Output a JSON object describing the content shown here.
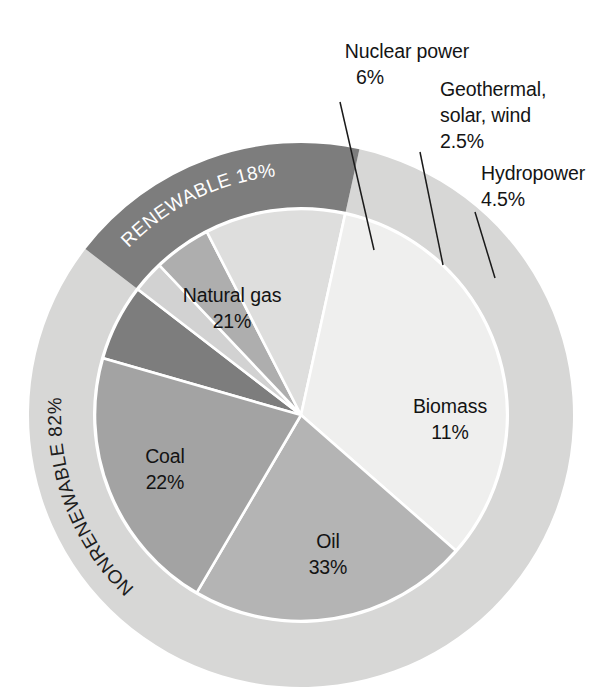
{
  "chart_data": {
    "type": "pie",
    "title": "",
    "subtitle": "",
    "xlabel": "",
    "ylabel": "",
    "legend_position": "none",
    "grid": false,
    "units": "percent",
    "categories": [
      "Nuclear power",
      "Geothermal, solar, wind",
      "Hydropower",
      "Biomass",
      "Oil",
      "Coal",
      "Natural gas"
    ],
    "values": [
      6,
      2.5,
      4.5,
      11,
      33,
      22,
      21
    ],
    "slices": [
      {
        "id": "nuclear",
        "label": "Nuclear power",
        "value": 6,
        "value_text": "6%",
        "color": "#7d7d7d",
        "label_kind": "callout"
      },
      {
        "id": "geothermal",
        "label": "Geothermal,\nsolar, wind",
        "value": 2.5,
        "value_text": "2.5%",
        "color": "#d2d2d2",
        "label_kind": "callout"
      },
      {
        "id": "hydropower",
        "label": "Hydropower",
        "value": 4.5,
        "value_text": "4.5%",
        "color": "#aeaeae",
        "label_kind": "callout"
      },
      {
        "id": "biomass",
        "label": "Biomass",
        "value": 11,
        "value_text": "11%",
        "color": "#dededd",
        "label_kind": "inside"
      },
      {
        "id": "oil",
        "label": "Oil",
        "value": 33,
        "value_text": "33%",
        "color": "#efefee",
        "label_kind": "inside"
      },
      {
        "id": "coal",
        "label": "Coal",
        "value": 22,
        "value_text": "22%",
        "color": "#b4b4b4",
        "label_kind": "inside"
      },
      {
        "id": "natural_gas",
        "label": "Natural gas",
        "value": 21,
        "value_text": "21%",
        "color": "#a3a3a3",
        "label_kind": "inside"
      }
    ],
    "outer_ring": [
      {
        "id": "renewable",
        "label": "RENEWABLE",
        "value": 18,
        "value_text": "RENEWABLE 18%",
        "color": "#7d7d7d",
        "text_color": "#ffffff"
      },
      {
        "id": "nonrenewable",
        "label": "NONRENEWABLE",
        "value": 82,
        "value_text": "NONRENEWABLE 82%",
        "color": "#d7d7d6",
        "text_color": "#1d1d1d"
      }
    ]
  },
  "callouts": {
    "nuclear": {
      "line1": "Nuclear power",
      "line2": "6%"
    },
    "geothermal": {
      "line1": "Geothermal,",
      "line2": "solar, wind",
      "line3": "2.5%"
    },
    "hydropower": {
      "line1": "Hydropower",
      "line2": "4.5%"
    }
  },
  "inside_labels": {
    "natural_gas": {
      "line1": "Natural gas",
      "line2": "21%"
    },
    "coal": {
      "line1": "Coal",
      "line2": "22%"
    },
    "oil": {
      "line1": "Oil",
      "line2": "33%"
    },
    "biomass": {
      "line1": "Biomass",
      "line2": "11%"
    }
  },
  "ring_labels": {
    "renewable": "RENEWABLE 18%",
    "nonrenewable": "NONRENEWABLE 82%"
  },
  "geometry": {
    "center_x": 301,
    "center_y": 415,
    "inner_radius": 206,
    "outer_radius": 272,
    "start_angle_deg": -74
  }
}
